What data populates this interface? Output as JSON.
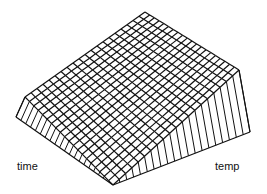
{
  "chart_data": {
    "type": "surface-wireframe",
    "title": "",
    "xlabel": "time",
    "ylabel": "temp",
    "zlabel": "",
    "grid_resolution": [
      20,
      20
    ],
    "surface": {
      "shape": "linear ramp",
      "z_front_corner": 0,
      "z_back_corner": 1,
      "z_left_corner": 0.55,
      "z_right_corner": 0.55
    },
    "projection_px": {
      "back_top": [
        145,
        12
      ],
      "left_top": [
        25,
        97
      ],
      "left_base": [
        16,
        117
      ],
      "right_top": [
        239,
        70
      ],
      "right_base": [
        250,
        132
      ],
      "front": [
        113,
        185
      ]
    },
    "line_color": "#111111",
    "background": "#ffffff",
    "axes_ticks": "none",
    "legend": "none"
  },
  "labels": {
    "x_axis": "time",
    "y_axis": "temp"
  }
}
